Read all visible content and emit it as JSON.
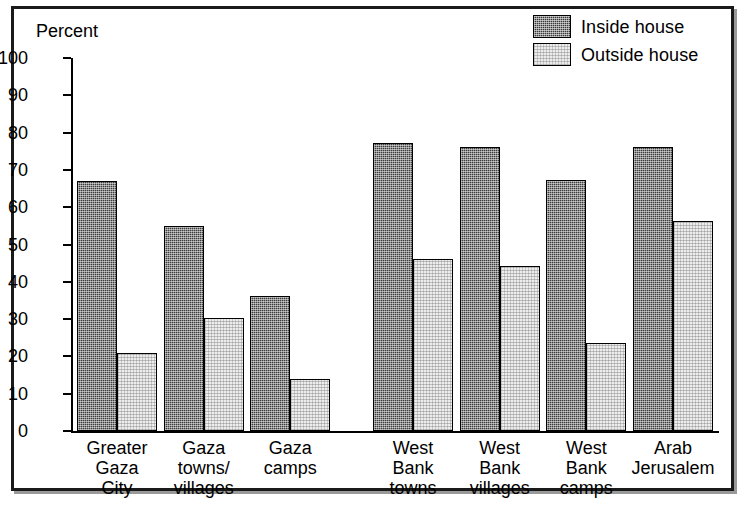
{
  "axis_title": "Percent",
  "legend": {
    "position": "top-right",
    "items": [
      {
        "label": "Inside house",
        "swatch": "dark-hatch",
        "color": "#3c3c3c"
      },
      {
        "label": "Outside house",
        "swatch": "light-hatch",
        "color": "#ededed"
      }
    ]
  },
  "chart_data": {
    "type": "bar",
    "title": "",
    "subtitle": "",
    "xlabel": "",
    "ylabel": "Percent",
    "ylim": [
      0,
      100
    ],
    "yticks": [
      0,
      10,
      20,
      30,
      40,
      50,
      60,
      70,
      80,
      90,
      100
    ],
    "grid": false,
    "legend_position": "top-right",
    "categories": [
      "Greater\nGaza\nCity",
      "Gaza\ntowns/\nvillages",
      "Gaza\ncamps",
      "West\nBank\ntowns",
      "West\nBank\nvillages",
      "West\nBank\ncamps",
      "Arab\nJerusalem"
    ],
    "group_break_after": 2,
    "series": [
      {
        "name": "Inside house",
        "color": "#3c3c3c",
        "values": [
          67,
          55,
          36.3,
          77.2,
          76.2,
          67.2,
          76.2
        ]
      },
      {
        "name": "Outside house",
        "color": "#ededed",
        "values": [
          21,
          30.3,
          14,
          46.2,
          44.2,
          23.5,
          56.4
        ]
      }
    ]
  }
}
